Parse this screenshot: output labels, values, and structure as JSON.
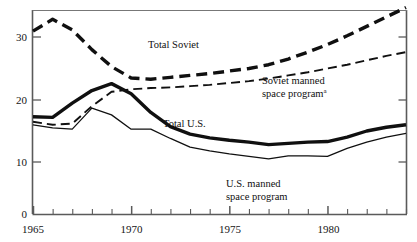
{
  "chart_data": {
    "type": "line",
    "title": "",
    "subtitle": "",
    "xlabel": "",
    "ylabel": "",
    "xlim": [
      1965,
      1984
    ],
    "ylim": [
      0,
      36
    ],
    "yticks": [
      0,
      10,
      20,
      30
    ],
    "ytick_labels": [
      "0",
      "10",
      "20",
      "30"
    ],
    "xticks": [
      1965,
      1966,
      1967,
      1968,
      1969,
      1970,
      1971,
      1972,
      1973,
      1974,
      1975,
      1976,
      1977,
      1978,
      1979,
      1980,
      1981,
      1982,
      1983,
      1984
    ],
    "xtick_labels_shown": [
      "1965",
      "1970",
      "1975",
      "1980"
    ],
    "xtick_labels_shown_at": [
      1965,
      1970,
      1975,
      1980
    ],
    "grid": false,
    "legend": "inline-annotations",
    "x": [
      1965,
      1966,
      1967,
      1968,
      1969,
      1970,
      1971,
      1972,
      1973,
      1974,
      1975,
      1976,
      1977,
      1978,
      1979,
      1980,
      1981,
      1982,
      1983,
      1984
    ],
    "series": [
      {
        "name": "Total Soviet",
        "style": "thick-dashed",
        "values": [
          31.0,
          33.0,
          31.2,
          28.0,
          25.3,
          23.5,
          23.3,
          23.6,
          23.9,
          24.2,
          24.6,
          25.0,
          25.6,
          26.5,
          27.6,
          28.8,
          30.2,
          31.8,
          33.4,
          35.0
        ]
      },
      {
        "name": "Soviet manned space program",
        "footnote_marker": "a",
        "style": "thin-dashed",
        "values": [
          16.5,
          16.0,
          16.2,
          19.0,
          21.3,
          21.7,
          21.9,
          22.0,
          22.2,
          22.4,
          22.7,
          23.0,
          23.4,
          23.9,
          24.4,
          25.0,
          25.6,
          26.3,
          27.0,
          27.6
        ]
      },
      {
        "name": "Total U.S.",
        "style": "thick-solid",
        "values": [
          17.3,
          17.2,
          19.5,
          21.5,
          22.6,
          21.0,
          18.0,
          15.7,
          14.5,
          13.9,
          13.5,
          13.2,
          12.8,
          13.0,
          13.2,
          13.3,
          14.0,
          15.0,
          15.6,
          16.0
        ]
      },
      {
        "name": "U.S. manned space program",
        "style": "thin-solid",
        "values": [
          16.0,
          15.5,
          15.3,
          18.7,
          17.6,
          15.3,
          15.3,
          13.8,
          12.4,
          11.8,
          11.3,
          10.9,
          10.5,
          11.0,
          11.0,
          10.9,
          12.2,
          13.2,
          14.0,
          14.6
        ]
      }
    ],
    "annotations": [
      {
        "text": "Total Soviet",
        "x": 1970.7,
        "y": 27.6
      },
      {
        "text": "Soviet manned space program",
        "x": 1977.0,
        "y": 20.5
      },
      {
        "text": "Total U.S.",
        "x": 1972.3,
        "y": 17.4
      },
      {
        "text": "U.S. manned space program",
        "x": 1977.6,
        "y": 7.2
      }
    ]
  },
  "axes": {
    "y_tick_labels": [
      "30",
      "20",
      "10",
      "0"
    ],
    "x_tick_labels": [
      "1965",
      "1970",
      "1975",
      "1980"
    ]
  },
  "labels": {
    "total_soviet": "Total Soviet",
    "soviet_manned_line1": "Soviet manned",
    "soviet_manned_line2": "space program",
    "soviet_manned_sup": "a",
    "total_us": "Total U.S.",
    "us_manned_line1": "U.S. manned",
    "us_manned_line2": "space program"
  },
  "colors": {
    "ink": "#101010",
    "axis": "#5a5a5a",
    "background": "#ffffff"
  }
}
